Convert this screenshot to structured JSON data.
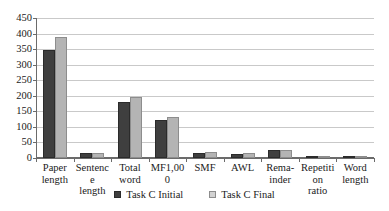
{
  "chart_data": {
    "type": "bar",
    "title": "",
    "subtitle": "",
    "xlabel": "",
    "ylabel": "",
    "ylim": [
      0,
      450
    ],
    "ytick_step": 50,
    "yticks": [
      0,
      50,
      100,
      150,
      200,
      250,
      300,
      350,
      400,
      450
    ],
    "ytick_labels": [
      "0",
      "50",
      "100",
      "150",
      "200",
      "250",
      "300",
      "350",
      "400",
      "450"
    ],
    "grid": true,
    "grid_axis": "y",
    "legend_position": "bottom",
    "categories": [
      "Paper length",
      "Sentence length",
      "Total word",
      "MF1,000",
      "SMF",
      "AWL",
      "Rema-inder",
      "Repetition ratio",
      "Word length"
    ],
    "category_labels": [
      {
        "line1": "Paper",
        "line2": "length"
      },
      {
        "line1": "Sentence",
        "line2": "length"
      },
      {
        "line1": "Total",
        "line2": "word"
      },
      {
        "line1": "MF1,000",
        "line2": ""
      },
      {
        "line1": "SMF",
        "line2": ""
      },
      {
        "line1": "AWL",
        "line2": ""
      },
      {
        "line1": "Rema-",
        "line2": "inder"
      },
      {
        "line1": "Repetition",
        "line2": "ratio"
      },
      {
        "line1": "Word",
        "line2": "length"
      }
    ],
    "series": [
      {
        "name": "Task C Initial",
        "color": "#3f3f3f",
        "values": [
          346,
          17,
          180,
          122,
          16,
          14,
          26,
          3,
          5
        ]
      },
      {
        "name": "Task C Final",
        "color": "#b4b4b4",
        "values": [
          390,
          17,
          195,
          133,
          18,
          16,
          27,
          3,
          5
        ]
      }
    ]
  },
  "legend": {
    "entries": [
      {
        "label": "Task C Initial",
        "swatch": "initial"
      },
      {
        "label": "Task C Final",
        "swatch": "final"
      }
    ]
  },
  "colors": {
    "series_initial": "#3f3f3f",
    "series_final": "#b4b4b4",
    "gridline": "#c9c9c9",
    "axis": "#6b6b6b",
    "background": "#ffffff",
    "text": "#1a1a1a"
  }
}
